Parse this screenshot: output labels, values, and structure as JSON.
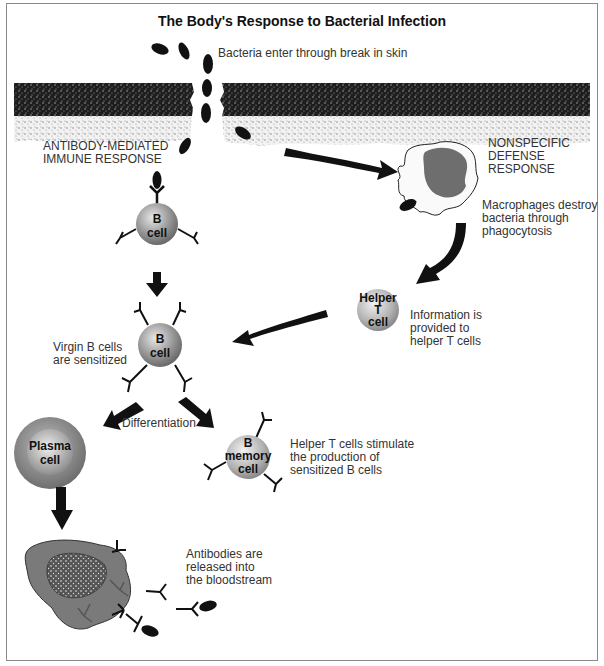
{
  "title": "The Body's Response to Bacterial Infection",
  "labels": {
    "bacteria_entry": "Bacteria enter through break in skin",
    "antibody_response_1": "ANTIBODY-MEDIATED",
    "antibody_response_2": "IMMUNE RESPONSE",
    "nonspecific_1": "NONSPECIFIC",
    "nonspecific_2": "DEFENSE",
    "nonspecific_3": "RESPONSE",
    "macrophage_1": "Macrophages destroy",
    "macrophage_2": "bacteria through",
    "macrophage_3": "phagocytosis",
    "info_1": "Information is",
    "info_2": "provided to",
    "info_3": "helper T cells",
    "virgin_1": "Virgin B cells",
    "virgin_2": "are sensitized",
    "differentiation": "Differentiation",
    "helper_stim_1": "Helper T cells stimulate",
    "helper_stim_2": "the production of",
    "helper_stim_3": "sensitized B cells",
    "antibodies_1": "Antibodies are",
    "antibodies_2": "released into",
    "antibodies_3": "the bloodstream"
  },
  "cells": {
    "b_cell_top": [
      "B",
      "cell"
    ],
    "b_cell_mid": [
      "B",
      "cell"
    ],
    "helper_t": [
      "Helper",
      "T",
      "cell"
    ],
    "plasma": [
      "Plasma",
      "cell"
    ],
    "b_memory": [
      "B",
      "memory",
      "cell"
    ]
  },
  "colors": {
    "cell_gray": "#8c8c8c",
    "dark": "#111111",
    "macrophage_nucleus": "#6e6e6e",
    "plasma_blob": "#7a7a7a"
  }
}
